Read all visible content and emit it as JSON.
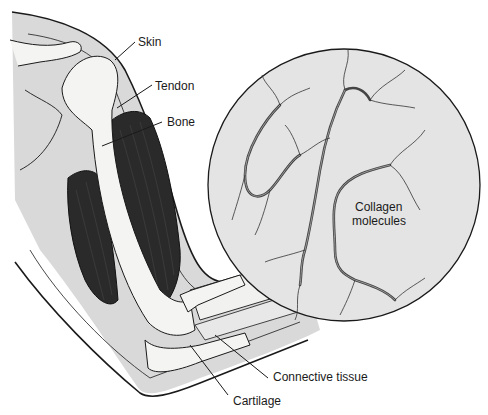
{
  "figure": {
    "labels": {
      "skin": "Skin",
      "tendon": "Tendon",
      "bone": "Bone",
      "collagen_line1": "Collagen",
      "collagen_line2": "molecules",
      "connective_tissue": "Connective tissue",
      "cartilage": "Cartilage"
    },
    "colors": {
      "skin_fill": "#d9d9d9",
      "muscle_fill": "#2a2a2a",
      "bone_fill": "#f4f4f2",
      "circle_fill": "#e4e4e4",
      "line": "#1a1a1a"
    }
  }
}
